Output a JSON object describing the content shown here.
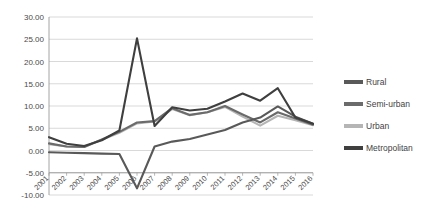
{
  "chart_data": {
    "type": "line",
    "title": "",
    "subtitle": "",
    "xlabel": "",
    "ylabel": "",
    "grid": true,
    "legend_position": "right",
    "categories": [
      "2001",
      "2002",
      "2003",
      "2004",
      "2005",
      "2006",
      "2007",
      "2008",
      "2009",
      "2010",
      "2011",
      "2012",
      "2013",
      "2014",
      "2015",
      "2016"
    ],
    "x": [
      2001,
      2002,
      2003,
      2004,
      2005,
      2006,
      2007,
      2008,
      2009,
      2010,
      2011,
      2012,
      2013,
      2014,
      2015,
      2016
    ],
    "ylim": [
      -10.0,
      30.0
    ],
    "ytick_step": 5.0,
    "ytick_labels": [
      "30.00",
      "25.00",
      "20.00",
      "15.00",
      "10.00",
      "5.00",
      "0.00",
      "-5.00",
      "-10.00"
    ],
    "ytick_values": [
      30.0,
      25.0,
      20.0,
      15.0,
      10.0,
      5.0,
      0.0,
      -5.0,
      -10.0
    ],
    "series": [
      {
        "name": "Rural",
        "color": "#595959",
        "values": [
          -0.4,
          -0.5,
          -0.6,
          -0.7,
          -0.8,
          -8.5,
          0.9,
          2.0,
          2.6,
          3.6,
          4.6,
          6.3,
          7.4,
          9.9,
          7.6,
          6.0
        ]
      },
      {
        "name": "Semi-urban",
        "color": "#6b6b6b",
        "values": [
          1.6,
          0.9,
          0.8,
          2.5,
          4.2,
          6.3,
          6.6,
          9.5,
          8.0,
          8.6,
          10.0,
          8.1,
          6.3,
          8.6,
          7.2,
          5.8
        ]
      },
      {
        "name": "Urban",
        "color": "#b5b5b5",
        "values": [
          1.4,
          0.9,
          0.8,
          2.4,
          4.0,
          6.1,
          6.5,
          9.3,
          7.9,
          8.6,
          9.8,
          7.6,
          5.6,
          7.8,
          6.8,
          5.7
        ]
      },
      {
        "name": "Metropolitan",
        "color": "#3f3f3f",
        "values": [
          3.0,
          1.5,
          1.0,
          2.3,
          4.5,
          25.2,
          5.5,
          9.7,
          9.0,
          9.4,
          11.0,
          12.8,
          11.2,
          14.0,
          7.4,
          6.0
        ]
      }
    ]
  },
  "legend": {
    "items": [
      {
        "label": "Rural",
        "color": "#595959"
      },
      {
        "label": "Semi-urban",
        "color": "#6b6b6b"
      },
      {
        "label": "Urban",
        "color": "#b5b5b5"
      },
      {
        "label": "Metropolitan",
        "color": "#3f3f3f"
      }
    ]
  }
}
